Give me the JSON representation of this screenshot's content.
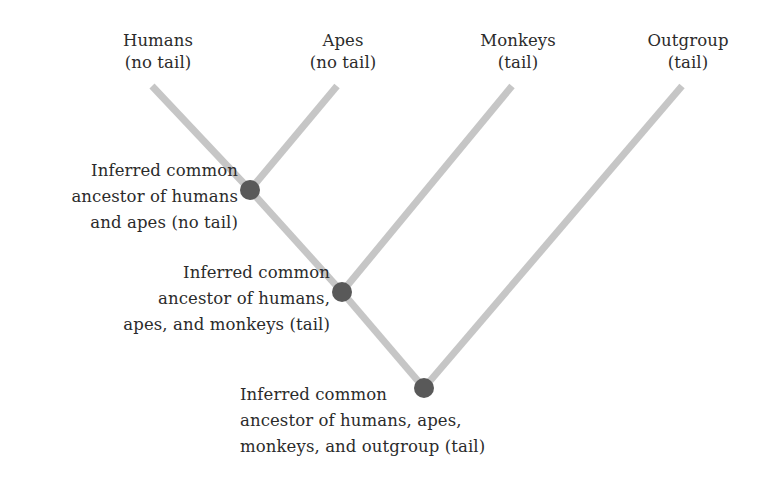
{
  "figure": {
    "type": "phylogenetic-tree-cladogram",
    "width": 782,
    "height": 487,
    "background_color": "#ffffff",
    "branch_color": "#c6c6c6",
    "node_color": "#595959",
    "text_color": "#2b2b2b"
  },
  "tips": [
    {
      "id": "humans",
      "line1": "Humans",
      "line2": "(no tail)",
      "label_center_x": 158,
      "label_top_y": 30,
      "tip_x": 152,
      "tip_y": 86
    },
    {
      "id": "apes",
      "line1": "Apes",
      "line2": "(no tail)",
      "label_center_x": 343,
      "label_top_y": 30,
      "tip_x": 337,
      "tip_y": 86
    },
    {
      "id": "monkeys",
      "line1": "Monkeys",
      "line2": "(tail)",
      "label_center_x": 518,
      "label_top_y": 30,
      "tip_x": 512,
      "tip_y": 86
    },
    {
      "id": "outgroup",
      "line1": "Outgroup",
      "line2": "(tail)",
      "label_center_x": 688,
      "label_top_y": 30,
      "tip_x": 682,
      "tip_y": 86
    }
  ],
  "internal_nodes": [
    {
      "id": "ancestor-humans-apes",
      "x": 250,
      "y": 190,
      "radius": 10,
      "annotation_lines": [
        "Inferred common",
        "ancestor of humans",
        "and apes (no tail)"
      ],
      "annotation_align": "right",
      "annotation_anchor_x": 238,
      "annotation_top_y": 158
    },
    {
      "id": "ancestor-humans-apes-monkeys",
      "x": 342,
      "y": 292,
      "radius": 10,
      "annotation_lines": [
        "Inferred common",
        "ancestor of humans,",
        "apes, and monkeys (tail)"
      ],
      "annotation_align": "right",
      "annotation_anchor_x": 330,
      "annotation_top_y": 260
    },
    {
      "id": "ancestor-all-root",
      "x": 424,
      "y": 388,
      "radius": 10,
      "annotation_lines": [
        "Inferred common",
        "ancestor of humans, apes,",
        "monkeys, and outgroup (tail)"
      ],
      "annotation_align": "left",
      "annotation_anchor_x": 240,
      "annotation_top_y": 382
    }
  ],
  "branches": [
    {
      "id": "branch-humans",
      "x1": 152,
      "y1": 86,
      "x2": 250,
      "y2": 190
    },
    {
      "id": "branch-apes",
      "x1": 337,
      "y1": 86,
      "x2": 250,
      "y2": 190
    },
    {
      "id": "branch-node1-to-node2",
      "x1": 250,
      "y1": 190,
      "x2": 342,
      "y2": 292
    },
    {
      "id": "branch-monkeys",
      "x1": 512,
      "y1": 86,
      "x2": 342,
      "y2": 292
    },
    {
      "id": "branch-node2-to-node3",
      "x1": 342,
      "y1": 292,
      "x2": 424,
      "y2": 388
    },
    {
      "id": "branch-outgroup",
      "x1": 682,
      "y1": 86,
      "x2": 424,
      "y2": 388
    }
  ]
}
